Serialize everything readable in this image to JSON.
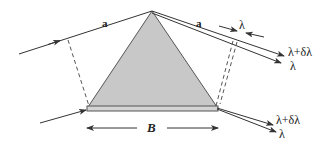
{
  "figure": {
    "colors": {
      "prism_fill": "#c8c8c8",
      "prism_stroke": "#555555",
      "ray": "#333333",
      "dashed": "#555555",
      "background": "#ffffff"
    }
  },
  "labels": {
    "top_left_ray": "a",
    "top_right_ray": "a",
    "wavelength_marker": "λ",
    "top_output_upper": "λ+δλ",
    "top_output_lower": "λ",
    "bottom_output_upper": "λ+δλ",
    "bottom_output_lower": "λ",
    "base_width": "B"
  }
}
